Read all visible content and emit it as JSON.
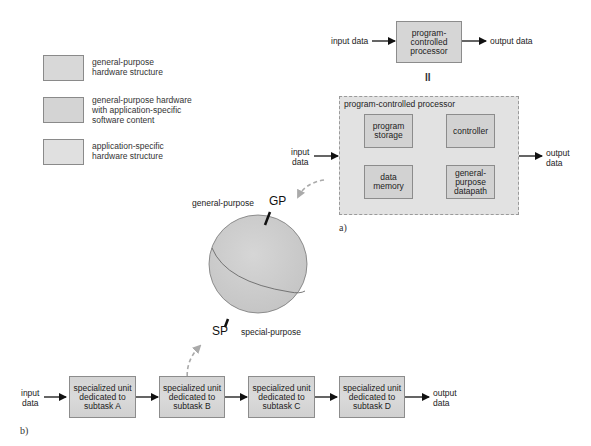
{
  "legend": {
    "items": [
      {
        "label_line1": "general-purpose",
        "label_line2": "hardware structure",
        "label_line3": "",
        "swatch": "general-purpose-hardware"
      },
      {
        "label_line1": "general-purpose hardware",
        "label_line2": "with application-specific",
        "label_line3": "software content",
        "swatch": "gp-hardware-app-software"
      },
      {
        "label_line1": "application-specific",
        "label_line2": "hardware structure",
        "label_line3": "",
        "swatch": "application-specific-hardware"
      }
    ]
  },
  "part_a": {
    "caption": "a)",
    "top_flow": {
      "input_label": "input data",
      "processor_line1": "program-",
      "processor_line2": "controlled",
      "processor_line3": "processor",
      "output_label": "output data"
    },
    "equals_symbol": "II",
    "detail": {
      "title": "program-controlled processor",
      "input_line1": "input",
      "input_line2": "data",
      "output_line1": "output",
      "output_line2": "data",
      "blocks": [
        {
          "line1": "program",
          "line2": "storage",
          "line3": ""
        },
        {
          "line1": "controller",
          "line2": "",
          "line3": ""
        },
        {
          "line1": "data",
          "line2": "memory",
          "line3": ""
        },
        {
          "line1": "general-",
          "line2": "purpose",
          "line3": "datapath"
        }
      ]
    }
  },
  "sphere": {
    "gp_label": "GP",
    "gp_text": "general-purpose",
    "sp_label": "SP",
    "sp_text": "special-purpose"
  },
  "part_b": {
    "caption": "b)",
    "input_line1": "input",
    "input_line2": "data",
    "output_line1": "output",
    "output_line2": "data",
    "units": [
      {
        "line1": "specialized unit",
        "line2": "dedicated to",
        "line3": "subtask A"
      },
      {
        "line1": "specialized unit",
        "line2": "dedicated to",
        "line3": "subtask B"
      },
      {
        "line1": "specialized unit",
        "line2": "dedicated to",
        "line3": "subtask C"
      },
      {
        "line1": "specialized unit",
        "line2": "dedicated to",
        "line3": "subtask D"
      }
    ]
  }
}
